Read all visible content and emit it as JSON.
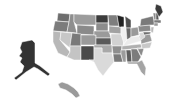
{
  "map": {
    "type": "choropleth",
    "region": "United States",
    "palette": "grayscale",
    "states": [
      {
        "id": "WA",
        "fill": "#6e6e6e",
        "points": "58,13 70,14 69,22 57,21"
      },
      {
        "id": "OR",
        "fill": "#7c7c7c",
        "points": "55,21 69,22 67,32 53,31"
      },
      {
        "id": "CA",
        "fill": "#b8b8b8",
        "points": "53,31 61,32 60,40 70,52 67,57 58,53 53,42"
      },
      {
        "id": "ID",
        "fill": "#8e8e8e",
        "points": "70,14 74,14 74,22 77,33 67,32 69,22"
      },
      {
        "id": "NV",
        "fill": "#c7c7c7",
        "points": "61,32 72,33 70,48 60,40"
      },
      {
        "id": "MT",
        "fill": "#9c9c9c",
        "points": "74,14 96,15 96,25 77,25 74,22"
      },
      {
        "id": "WY",
        "fill": "#8a8a8a",
        "points": "77,25 94,26 94,35 77,34"
      },
      {
        "id": "UT",
        "fill": "#7a7a7a",
        "points": "72,33 81,34 81,46 70,46"
      },
      {
        "id": "AZ",
        "fill": "#c4c4c4",
        "points": "70,46 81,46 81,60 74,60 67,57 70,52"
      },
      {
        "id": "CO",
        "fill": "#9a9a9a",
        "points": "81,35 96,35 96,45 81,45"
      },
      {
        "id": "NM",
        "fill": "#4a4a4a",
        "points": "81,46 94,46 94,60 81,60"
      },
      {
        "id": "ND",
        "fill": "#3c3c3c",
        "points": "96,15 108,15 108,23 96,23"
      },
      {
        "id": "SD",
        "fill": "#8c8c8c",
        "points": "96,23 108,23 108,31 96,31"
      },
      {
        "id": "NE",
        "fill": "#9a9a9a",
        "points": "94,31 109,31 111,38 96,38 96,35 94,35"
      },
      {
        "id": "KS",
        "fill": "#5a5a5a",
        "points": "96,38 111,38 111,45 96,45"
      },
      {
        "id": "OK",
        "fill": "#a8a8a8",
        "points": "94,45 112,45 112,53 102,53 102,48 94,48"
      },
      {
        "id": "TX",
        "fill": "#dadada",
        "points": "94,48 102,48 102,53 112,53 114,62 109,68 103,76 98,70 94,62 89,60 94,60"
      },
      {
        "id": "MN",
        "fill": "#7e7e7e",
        "points": "108,15 117,15 119,26 109,26"
      },
      {
        "id": "IA",
        "fill": "#a2a2a2",
        "points": "109,26 121,27 121,34 109,33"
      },
      {
        "id": "MO",
        "fill": "#d2d2d2",
        "points": "111,34 121,34 124,40 123,46 112,46 111,38"
      },
      {
        "id": "AR",
        "fill": "#8e8e8e",
        "points": "112,46 122,46 121,54 113,54"
      },
      {
        "id": "LA",
        "fill": "#7a7a7a",
        "points": "113,54 121,54 123,62 114,62"
      },
      {
        "id": "WI",
        "fill": "#222222",
        "points": "117,15 124,17 124,27 119,27"
      },
      {
        "id": "IL",
        "fill": "#f0f0f0",
        "points": "121,27 126,27 127,40 124,44 121,34"
      },
      {
        "id": "MI",
        "fill": "#4e4e4e",
        "points": "125,16 131,20 131,28 126,28"
      },
      {
        "id": "IN",
        "fill": "#6a6a6a",
        "points": "126,28 131,28 131,38 127,40"
      },
      {
        "id": "OH",
        "fill": "#9a9a9a",
        "points": "131,28 138,27 139,35 131,37"
      },
      {
        "id": "KY",
        "fill": "#ececec",
        "points": "124,44 127,40 131,37 139,36 141,41 124,46"
      },
      {
        "id": "TN",
        "fill": "#b0b0b0",
        "points": "122,46 141,44 142,48 122,50"
      },
      {
        "id": "MS",
        "fill": "#9c9c9c",
        "points": "121,50 126,50 126,62 123,62 121,54"
      },
      {
        "id": "AL",
        "fill": "#5e5e5e",
        "points": "126,50 131,50 132,62 127,62"
      },
      {
        "id": "GA",
        "fill": "#7c7c7c",
        "points": "131,49 137,49 141,57 138,62 132,62"
      },
      {
        "id": "FL",
        "fill": "#a4a4a4",
        "points": "127,62 138,62 142,60 146,68 145,76 141,72 137,64 128,64"
      },
      {
        "id": "SC",
        "fill": "#8a8a8a",
        "points": "137,48 144,48 142,55 141,56"
      },
      {
        "id": "NC",
        "fill": "#c8c8c8",
        "points": "141,44 152,42 150,48 137,49 142,48"
      },
      {
        "id": "VA",
        "fill": "#9a9a9a",
        "points": "139,36 150,34 152,41 141,44 141,41"
      },
      {
        "id": "WV",
        "fill": "#d8d8d8",
        "points": "139,33 143,32 145,37 141,40"
      },
      {
        "id": "PA",
        "fill": "#8a8a8a",
        "points": "138,26 150,25 151,31 139,32"
      },
      {
        "id": "NY",
        "fill": "#7a7a7a",
        "points": "141,19 153,16 155,25 150,25 140,26"
      },
      {
        "id": "NJ",
        "fill": "#b8b8b8",
        "points": "151,27 154,27 153,33 151,32"
      },
      {
        "id": "MD",
        "fill": "#6e6e6e",
        "points": "143,32 151,32 150,34 144,35"
      },
      {
        "id": "VT",
        "fill": "#8a8a8a",
        "points": "153,13 156,13 156,20 154,20"
      },
      {
        "id": "NH",
        "fill": "#5a5a5a",
        "points": "156,13 158,13 159,20 156,20"
      },
      {
        "id": "ME",
        "fill": "#3a3a3a",
        "points": "156,4 161,6 163,12 159,17 157,13 155,9"
      },
      {
        "id": "MA",
        "fill": "#7a7a7a",
        "points": "154,20 161,20 161,23 154,23"
      },
      {
        "id": "CT",
        "fill": "#9a9a9a",
        "points": "154,23 158,23 158,26 154,26"
      },
      {
        "id": "AK",
        "fill": "#333333",
        "points": "22,42 32,40 35,43 35,63 40,66 50,74 48,76 38,69 34,67 26,72 16,80 14,78 22,72 24,66 20,62 22,58 19,56 22,52 20,48"
      },
      {
        "id": "HI",
        "fill": "#9a9a9a",
        "points": "58,84 62,82 68,84 74,88 78,92 80,96 76,98 72,94 66,90 60,88"
      }
    ]
  }
}
